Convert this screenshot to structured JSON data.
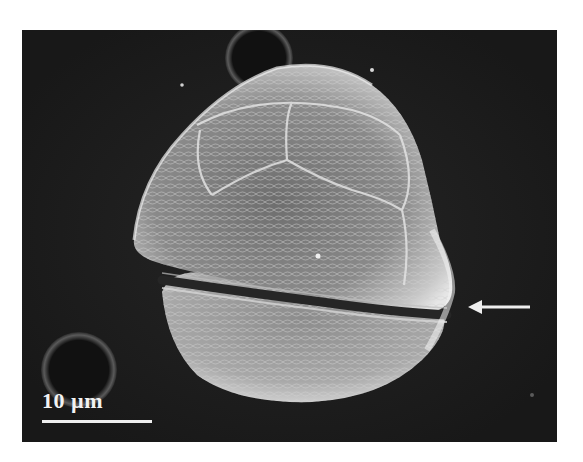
{
  "figure": {
    "type": "scanning electron micrograph",
    "background_color": "#1c1c1c",
    "page_background": "#ffffff"
  },
  "scale_bar": {
    "label": "10 µm",
    "color": "#eeeeee"
  },
  "annotations": [
    {
      "type": "arrow",
      "direction": "left",
      "target": "cingulum",
      "color": "#eeeeee"
    }
  ]
}
